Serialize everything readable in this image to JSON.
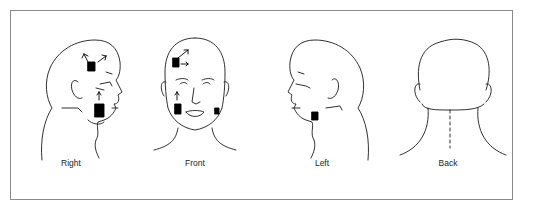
{
  "figure": {
    "views": [
      {
        "id": "right",
        "label": "Right",
        "markings": [
          "arrow up-left (temple)",
          "arrow up-right (temple)",
          "shaded area (temple)",
          "arrow up (cheek)",
          "shaded area (jaw/cheek)"
        ]
      },
      {
        "id": "front",
        "label": "Front",
        "markings": [
          "arrow up-right (forehead)",
          "arrow right (forehead)",
          "shaded area (right forehead)",
          "arrow up (right cheek)",
          "shaded area (right jaw)",
          "shaded area (left jaw)"
        ]
      },
      {
        "id": "left",
        "label": "Left",
        "markings": [
          "shaded area (jaw angle)"
        ]
      },
      {
        "id": "back",
        "label": "Back",
        "markings": [
          "dashed midline (neck)"
        ]
      }
    ],
    "colors": {
      "line": "#1a1a1a",
      "frame": "#8a8a8a",
      "fill": "#000000"
    }
  }
}
